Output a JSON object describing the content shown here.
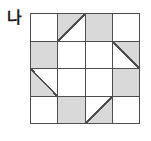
{
  "figure": {
    "label": "나"
  },
  "colors": {
    "background": "#ffffff",
    "shade": "#d9d9d9",
    "line": "#4d4d4d"
  },
  "grid": {
    "rows": 4,
    "cols": 4,
    "cells": [
      [
        "white",
        "tri-ul",
        "gray",
        "white"
      ],
      [
        "gray",
        "white",
        "white",
        "tri-ur"
      ],
      [
        "tri-ll",
        "white",
        "white",
        "gray"
      ],
      [
        "white",
        "gray",
        "tri-lr",
        "white"
      ]
    ],
    "cell_legend": {
      "white": "unshaded square",
      "gray": "fully shaded square",
      "tri-ul": "upper-left half shaded (diagonal bottom-left to top-right)",
      "tri-ur": "upper-right half shaded (diagonal top-left to bottom-right)",
      "tri-ll": "lower-left half shaded (diagonal top-left to bottom-right)",
      "tri-lr": "lower-right half shaded (diagonal bottom-left to top-right)"
    }
  }
}
